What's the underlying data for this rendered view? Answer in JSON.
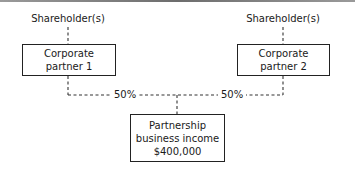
{
  "diagram": {
    "shareholders": [
      {
        "label": "Shareholder(s)"
      },
      {
        "label": "Shareholder(s)"
      }
    ],
    "partners": [
      {
        "line1": "Corporate",
        "line2": "partner 1"
      },
      {
        "line1": "Corporate",
        "line2": "partner 2"
      }
    ],
    "ownership": [
      {
        "value": "50%"
      },
      {
        "value": "50%"
      }
    ],
    "partnership": {
      "line1": "Partnership",
      "line2": "business income",
      "line3": "$400,000"
    }
  }
}
